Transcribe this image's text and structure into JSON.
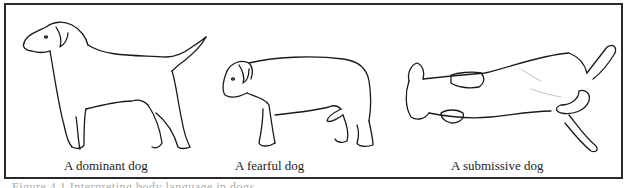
{
  "figure": {
    "panels": [
      {
        "id": "dominant",
        "caption": "A dominant dog",
        "illustration": "standing-dog-tail-raised"
      },
      {
        "id": "fearful",
        "caption": "A fearful dog",
        "illustration": "cowering-dog-tail-tucked"
      },
      {
        "id": "submissive",
        "caption": "A submissive dog",
        "illustration": "dog-lying-on-back"
      }
    ],
    "border_color": "#2a2a2a"
  },
  "footer": {
    "partial_text": "Figure 4.1 Interpreting body language in dogs"
  }
}
